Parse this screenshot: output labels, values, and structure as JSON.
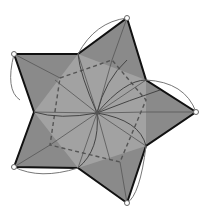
{
  "diagram": {
    "colors": {
      "background": "#ffffff",
      "fill_outer": "#8a8a8a",
      "fill_inner": "#a0a0a0",
      "edge": "#111111",
      "crease": "#555555",
      "dashed": "#555555",
      "arc": "#777777",
      "vertex_marker_fill": "#ffffff",
      "vertex_marker_stroke": "#666666"
    },
    "center": [
      97,
      113
    ],
    "outer_vertices": [
      [
        127,
        18
      ],
      [
        196,
        112
      ],
      [
        127,
        203
      ],
      [
        14,
        167
      ],
      [
        14,
        54
      ]
    ],
    "inner_vertices": [
      [
        78,
        54
      ],
      [
        146,
        80
      ],
      [
        146,
        146
      ],
      [
        78,
        168
      ],
      [
        34,
        112
      ]
    ],
    "dashed_pentagon": [
      [
        72,
        62
      ],
      [
        145,
        80
      ],
      [
        146,
        148
      ],
      [
        78,
        166
      ],
      [
        35,
        110
      ]
    ]
  }
}
